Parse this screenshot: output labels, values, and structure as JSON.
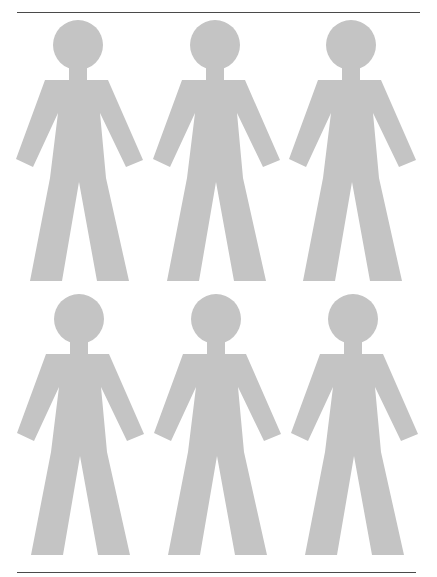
{
  "page": {
    "width": 437,
    "height": 577,
    "background": "#ffffff"
  },
  "rules": {
    "color": "#4a4a4a",
    "top": {
      "x1": 17,
      "x2": 420,
      "y": 12
    },
    "bottom": {
      "x1": 17,
      "x2": 416,
      "y": 572
    }
  },
  "figures": {
    "fill": "#c4c4c4",
    "count": 6,
    "rows": 2,
    "columns": 3,
    "items": [
      {
        "row": 1,
        "col": 1,
        "cx": 78,
        "cy": 0
      },
      {
        "row": 1,
        "col": 2,
        "cx": 215,
        "cy": 0
      },
      {
        "row": 1,
        "col": 3,
        "cx": 351,
        "cy": 0
      },
      {
        "row": 2,
        "col": 1,
        "cx": 79,
        "cy": 274
      },
      {
        "row": 2,
        "col": 2,
        "cx": 216,
        "cy": 274
      },
      {
        "row": 2,
        "col": 3,
        "cx": 353,
        "cy": 274
      }
    ]
  }
}
